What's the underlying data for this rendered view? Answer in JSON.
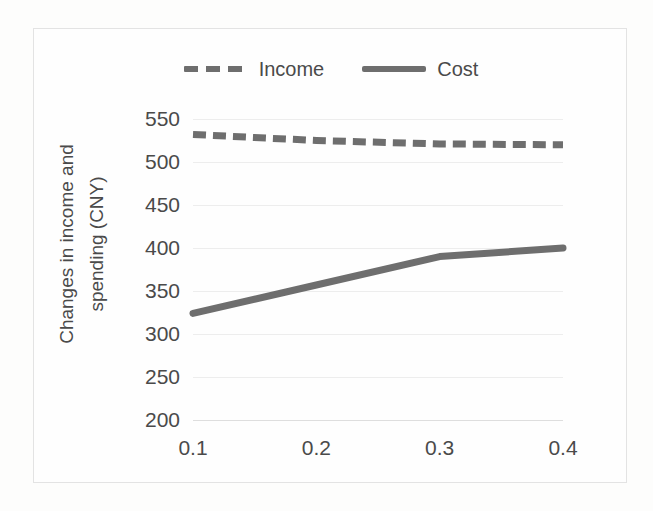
{
  "figure": {
    "background_color": "#fdfdfc",
    "frame_color": "#e3e3e3",
    "line_color": "#6e6e6e",
    "grid_color": "#ededed",
    "text_color": "#4a4a4a"
  },
  "legend": {
    "position": "top-center",
    "entries": [
      {
        "label": "Income",
        "style": "dashed",
        "key_name": "legend-key-income"
      },
      {
        "label": "Cost",
        "style": "solid",
        "key_name": "legend-key-cost"
      }
    ]
  },
  "axes": {
    "y_title_line1": "Changes in income and",
    "y_title_line2": "spending (CNY)",
    "x_title": "",
    "y_ticks": [
      "550",
      "500",
      "450",
      "400",
      "350",
      "300",
      "250",
      "200"
    ],
    "x_ticks": [
      "0.1",
      "0.2",
      "0.3",
      "0.4"
    ]
  },
  "chart_data": {
    "type": "line",
    "title": "",
    "xlabel": "",
    "ylabel": "Changes in income and spending (CNY)",
    "categories": [
      "0.1",
      "0.2",
      "0.3",
      "0.4"
    ],
    "x": [
      0.1,
      0.2,
      0.3,
      0.4
    ],
    "series": [
      {
        "name": "Income",
        "style": "dashed",
        "color": "#6e6e6e",
        "values": [
          532,
          525,
          521,
          520
        ]
      },
      {
        "name": "Cost",
        "style": "solid",
        "color": "#6e6e6e",
        "values": [
          324,
          357,
          390,
          400
        ]
      }
    ],
    "ylim": [
      200,
      550
    ],
    "ytick_step": 50,
    "xlim": [
      0.1,
      0.4
    ],
    "grid": true,
    "grid_axis": "y",
    "legend_position": "top-center"
  }
}
